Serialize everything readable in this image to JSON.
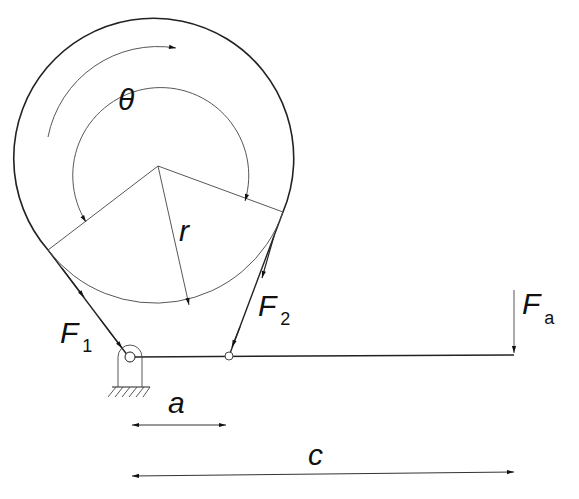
{
  "diagram": {
    "type": "band brake schematic",
    "labels": {
      "angle": "θ",
      "radius": "r",
      "force1": "F",
      "force1_sub": "1",
      "force2": "F",
      "force2_sub": "2",
      "applied_force": "F",
      "applied_force_sub": "a",
      "dim_a": "a",
      "dim_c": "c"
    },
    "elements": [
      "drum (circle)",
      "band wrapped over drum",
      "wrap angle arc θ",
      "radius r",
      "lever arm",
      "fixed pivot with ground hatch",
      "band attachment pin",
      "applied force arrow Fa",
      "dimension a",
      "dimension c"
    ],
    "colors": {
      "line": "#222222",
      "background": "#ffffff"
    }
  }
}
